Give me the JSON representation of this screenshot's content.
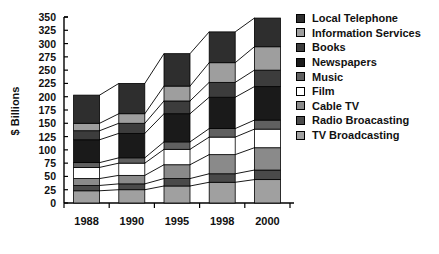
{
  "chart_data": {
    "type": "bar",
    "stacked": true,
    "title": "",
    "xlabel": "",
    "ylabel": "$ Billions",
    "categories": [
      "1988",
      "1990",
      "1995",
      "1998",
      "2000"
    ],
    "ylim": [
      0,
      350
    ],
    "ytick_step": 25,
    "yticks": [
      "0",
      "25",
      "50",
      "75",
      "100",
      "125",
      "150",
      "175",
      "200",
      "225",
      "250",
      "275",
      "300",
      "325",
      "350"
    ],
    "grid": false,
    "legend_position": "right",
    "connector_lines": true,
    "series": [
      {
        "name": "TV Broadcasting",
        "color": "#a0a0a0",
        "values": [
          23,
          25,
          32,
          39,
          44
        ]
      },
      {
        "name": "Radio Broacasting",
        "color": "#4a4a4a",
        "values": [
          10,
          11,
          14,
          16,
          18
        ]
      },
      {
        "name": "Cable TV",
        "color": "#8a8a8a",
        "values": [
          13,
          16,
          26,
          36,
          42
        ]
      },
      {
        "name": "Film",
        "color": "#ffffff",
        "values": [
          21,
          23,
          29,
          33,
          35
        ]
      },
      {
        "name": "Music",
        "color": "#606060",
        "values": [
          9,
          10,
          14,
          16,
          17
        ]
      },
      {
        "name": "Newspapers",
        "color": "#1a1a1a",
        "values": [
          43,
          46,
          53,
          59,
          63
        ]
      },
      {
        "name": "Books",
        "color": "#3c3c3c",
        "values": [
          17,
          19,
          24,
          28,
          31
        ]
      },
      {
        "name": "Information Services",
        "color": "#9e9e9e",
        "values": [
          14,
          18,
          28,
          37,
          44
        ]
      },
      {
        "name": "Local Telephone",
        "color": "#2e2e2e",
        "values": [
          53,
          57,
          61,
          58,
          54
        ]
      }
    ],
    "totals": [
      203,
      225,
      281,
      322,
      348
    ]
  },
  "legend": {
    "items": [
      {
        "label": "Local Telephone",
        "color": "#2e2e2e",
        "icon": "legend-swatch-icon"
      },
      {
        "label": "Information Services",
        "color": "#9e9e9e",
        "icon": "legend-swatch-icon"
      },
      {
        "label": "Books",
        "color": "#3c3c3c",
        "icon": "legend-swatch-icon"
      },
      {
        "label": "Newspapers",
        "color": "#1a1a1a",
        "icon": "legend-swatch-icon"
      },
      {
        "label": "Music",
        "color": "#606060",
        "icon": "legend-swatch-icon"
      },
      {
        "label": "Film",
        "color": "#ffffff",
        "icon": "legend-swatch-icon"
      },
      {
        "label": "Cable TV",
        "color": "#8a8a8a",
        "icon": "legend-swatch-icon"
      },
      {
        "label": "Radio Broacasting",
        "color": "#4a4a4a",
        "icon": "legend-swatch-icon"
      },
      {
        "label": "TV Broadcasting",
        "color": "#a0a0a0",
        "icon": "legend-swatch-icon"
      }
    ]
  },
  "colors": {
    "axis": "#000000",
    "text": "#111111",
    "background": "#ffffff"
  }
}
